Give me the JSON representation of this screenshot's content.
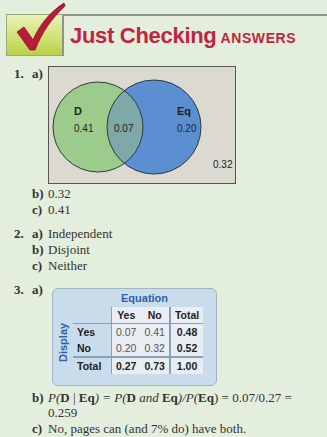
{
  "header": {
    "title": "Just Checking",
    "subtitle": "ANSWERS",
    "icon": "checkmark-icon",
    "colors": {
      "title": "#c0253e",
      "check_box": "#cfe070"
    }
  },
  "q1": {
    "number": "1.",
    "a": {
      "letter": "a)",
      "venn": {
        "set1_label": "D",
        "set1_only": "0.41",
        "intersection": "0.07",
        "set2_label": "Eq",
        "set2_only": "0.20",
        "outside": "0.32",
        "colors": {
          "set1": "#9ccc8c",
          "set2": "#5b8fd2",
          "overlap": "#7ea9a8",
          "background": "#dcdad0"
        }
      }
    },
    "b": {
      "letter": "b)",
      "text": "0.32"
    },
    "c": {
      "letter": "c)",
      "text": "0.41"
    }
  },
  "q2": {
    "number": "2.",
    "a": {
      "letter": "a)",
      "text": "Independent"
    },
    "b": {
      "letter": "b)",
      "text": "Disjoint"
    },
    "c": {
      "letter": "c)",
      "text": "Neither"
    }
  },
  "q3": {
    "number": "3.",
    "a": {
      "letter": "a)",
      "table": {
        "column_variable": "Equation",
        "row_variable": "Display",
        "columns": [
          "Yes",
          "No",
          "Total"
        ],
        "rows": [
          {
            "label": "Yes",
            "values": [
              "0.07",
              "0.41"
            ],
            "total": "0.48"
          },
          {
            "label": "No",
            "values": [
              "0.20",
              "0.32"
            ],
            "total": "0.52"
          },
          {
            "label": "Total",
            "values": [
              "0.27",
              "0.73"
            ],
            "total": "1.00"
          }
        ]
      }
    },
    "b": {
      "letter": "b)",
      "line1": "P(D | Eq) = P(D and Eq)/P(Eq) = 0.07/0.27 =",
      "line1_parts": {
        "p1": "P(",
        "d1": "D",
        "bar": " | ",
        "eq1": "Eq",
        "p1c": ") = P(",
        "d2": "D",
        "and": " and ",
        "eq2": "Eq",
        "mid": ")/P(",
        "eq3": "Eq",
        "end": ") = 0.07/0.27 ="
      },
      "line2": "0.259"
    },
    "c": {
      "letter": "c)",
      "text": "No, pages can (and 7% do) have both."
    }
  }
}
